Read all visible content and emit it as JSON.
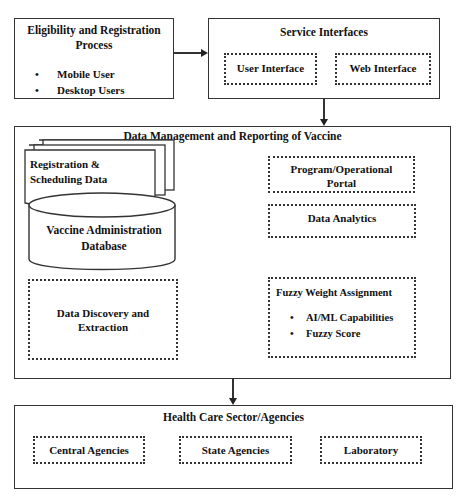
{
  "eligibility": {
    "title": "Eligibility and Registration Process",
    "items": [
      "Mobile User",
      "Desktop Users"
    ],
    "bullet": "•"
  },
  "service_interfaces": {
    "title": "Service Interfaces",
    "items": [
      "User Interface",
      "Web Interface"
    ]
  },
  "data_management": {
    "title": "Data Management and Reporting of Vaccine",
    "registration_doc": "Registration & Scheduling Data",
    "registration_line1": "Registration &",
    "registration_line2": "Scheduling Data",
    "database_line1": "Vaccine Administration",
    "database_line2": "Database",
    "discovery": "Data Discovery and Extraction",
    "portal": "Program/Operational Portal",
    "analytics": "Data Analytics",
    "fuzzy": {
      "title": "Fuzzy Weight Assignment",
      "items": [
        "AI/ML Capabilities",
        "Fuzzy Score"
      ]
    }
  },
  "health_care": {
    "title": "Health Care Sector/Agencies",
    "items": [
      "Central Agencies",
      "State Agencies",
      "Laboratory"
    ]
  },
  "colors": {
    "stroke": "#333333",
    "text": "#111111",
    "background": "#ffffff"
  }
}
